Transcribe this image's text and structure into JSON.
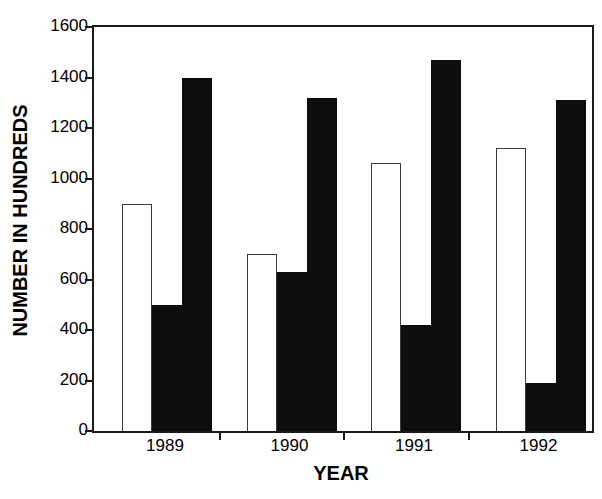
{
  "chart_data": {
    "type": "bar",
    "title": "",
    "subtitle": "",
    "xlabel": "YEAR",
    "ylabel": "NUMBER IN HUNDREDS",
    "categories": [
      "1989",
      "1990",
      "1991",
      "1992"
    ],
    "ylim": [
      0,
      1600
    ],
    "yticks": [
      0,
      200,
      400,
      600,
      800,
      1000,
      1200,
      1400,
      1600
    ],
    "ytick_labels": [
      "0",
      "200",
      "400",
      "600",
      "800",
      "1000",
      "1200",
      "1400",
      "1600"
    ],
    "grid": false,
    "legend": "none",
    "legend_position": "none",
    "series": [
      {
        "name": "series-1",
        "style": "white-outlined",
        "color": "#ffffff",
        "edge_color": "#3a3a3a",
        "values": [
          900,
          700,
          1060,
          1120
        ]
      },
      {
        "name": "series-2",
        "style": "solid-black",
        "color": "#0d0d0d",
        "edge_color": "#0d0d0d",
        "values": [
          500,
          630,
          420,
          190
        ]
      },
      {
        "name": "series-3",
        "style": "solid-black",
        "color": "#0d0d0d",
        "edge_color": "#0d0d0d",
        "values": [
          1400,
          1320,
          1470,
          1310
        ]
      }
    ],
    "frame": "full-box",
    "axis_color": "#1a1a1a"
  }
}
